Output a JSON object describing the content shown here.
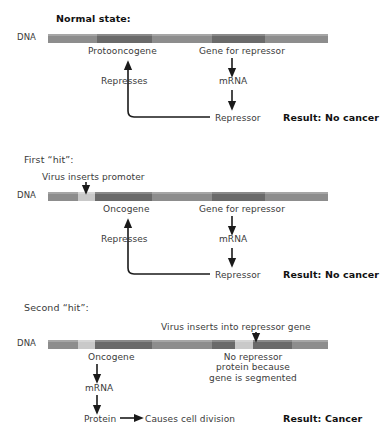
{
  "figure": {
    "dna_row_label": "DNA"
  },
  "panels": [
    {
      "title": "Normal state:",
      "gene_labels": {
        "left": "Protooncogene",
        "right": "Gene for repressor"
      },
      "flow": {
        "mrna": "mRNA",
        "repressor": "Repressor",
        "represses": "Represses"
      },
      "result": "Result: No cancer",
      "segments": [
        {
          "name": "upstream",
          "kind": "base",
          "width": 49
        },
        {
          "name": "protooncogene",
          "kind": "gene",
          "width": 55
        },
        {
          "name": "spacer",
          "kind": "base",
          "width": 60
        },
        {
          "name": "repressor-gene",
          "kind": "gene",
          "width": 53
        },
        {
          "name": "downstream",
          "kind": "base",
          "width": 63
        }
      ]
    },
    {
      "title": "First “hit”:",
      "annotation": "Virus inserts promoter",
      "gene_labels": {
        "left": "Oncogene",
        "right": "Gene for repressor"
      },
      "flow": {
        "mrna": "mRNA",
        "repressor": "Repressor",
        "represses": "Represses"
      },
      "result": "Result: No cancer",
      "segments": [
        {
          "name": "upstream",
          "kind": "base",
          "width": 30
        },
        {
          "name": "virus-promoter",
          "kind": "light",
          "width": 17
        },
        {
          "name": "oncogene",
          "kind": "gene",
          "width": 57
        },
        {
          "name": "spacer",
          "kind": "base",
          "width": 60
        },
        {
          "name": "repressor-gene",
          "kind": "gene",
          "width": 53
        },
        {
          "name": "downstream",
          "kind": "base",
          "width": 63
        }
      ]
    },
    {
      "title": "Second “hit”:",
      "annotation": "Virus inserts into repressor gene",
      "gene_labels": {
        "left": "Oncogene",
        "right": "No repressor\nprotein because\ngene is segmented"
      },
      "flow": {
        "mrna": "mRNA",
        "protein": "Protein",
        "effect": "Causes cell division"
      },
      "result": "Result: Cancer",
      "segments": [
        {
          "name": "upstream",
          "kind": "base",
          "width": 30
        },
        {
          "name": "virus-promoter",
          "kind": "light",
          "width": 17
        },
        {
          "name": "oncogene",
          "kind": "gene",
          "width": 57
        },
        {
          "name": "spacer",
          "kind": "base",
          "width": 60
        },
        {
          "name": "repressor-gene-part1",
          "kind": "gene",
          "width": 23
        },
        {
          "name": "virus-insert",
          "kind": "light",
          "width": 18
        },
        {
          "name": "repressor-gene-part2",
          "kind": "gene",
          "width": 39
        },
        {
          "name": "downstream",
          "kind": "base",
          "width": 36
        }
      ]
    }
  ],
  "colors": {
    "base": "#8d8d8d",
    "gene": "#6a6a6a",
    "light": "#c9c9c9",
    "text": "#3a3a3a",
    "bold": "#111111"
  }
}
